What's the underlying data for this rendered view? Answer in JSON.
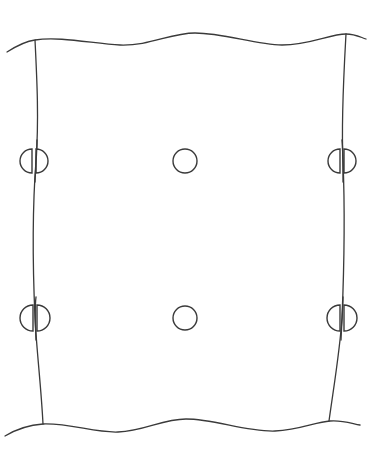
{
  "diagram": {
    "title": "",
    "colors": {
      "background": "#ffffff",
      "stroke": "#3a3a3a"
    },
    "elements": {
      "panel": {
        "label": "",
        "edges": [
          "top-wavy-edge",
          "bottom-wavy-edge",
          "left-edge",
          "right-edge"
        ]
      },
      "rows": [
        {
          "name": "upper-row",
          "items": [
            {
              "kind": "split-fastener",
              "position": "left-edge"
            },
            {
              "kind": "hole",
              "position": "center"
            },
            {
              "kind": "split-fastener",
              "position": "right-edge"
            }
          ]
        },
        {
          "name": "lower-row",
          "items": [
            {
              "kind": "split-fastener",
              "position": "left-edge"
            },
            {
              "kind": "hole",
              "position": "center"
            },
            {
              "kind": "split-fastener",
              "position": "right-edge"
            }
          ]
        }
      ],
      "labels": []
    }
  }
}
